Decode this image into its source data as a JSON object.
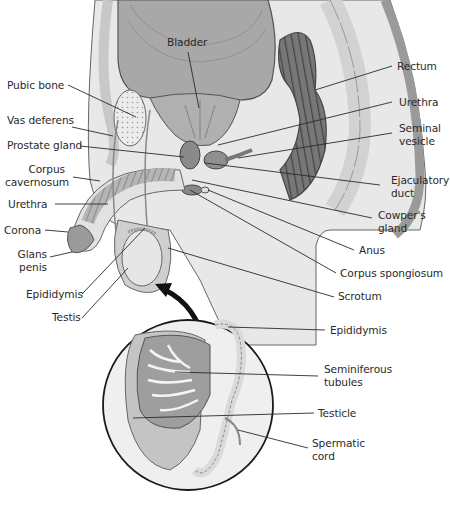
{
  "diagram": {
    "type": "anatomical cross-section",
    "colors": {
      "background": "#ffffff",
      "tissue_light": "#e4e4e4",
      "tissue_mid": "#c8c8c8",
      "tissue_dark": "#8e8e8e",
      "outline": "#555555",
      "leader": "#2a2a2a",
      "arrow": "#111111"
    },
    "labels": {
      "bladder": "Bladder",
      "pubic_bone": "Pubic bone",
      "vas_deferens": "Vas deferens",
      "prostate_gland": "Prostate gland",
      "corpus_cavernosum_1": "Corpus",
      "corpus_cavernosum_2": "cavernosum",
      "urethra_left": "Urethra",
      "corona": "Corona",
      "glans_penis_1": "Glans",
      "glans_penis_2": "penis",
      "epididymis_left": "Epididymis",
      "testis": "Testis",
      "rectum": "Rectum",
      "urethra_right": "Urethra",
      "seminal_vesicle_1": "Seminal",
      "seminal_vesicle_2": "vesicle",
      "ejaculatory_duct_1": "Ejaculatory",
      "ejaculatory_duct_2": "duct",
      "cowpers_gland_1": "Cowper's",
      "cowpers_gland_2": "gland",
      "anus": "Anus",
      "corpus_spongiosum": "Corpus spongiosum",
      "scrotum": "Scrotum"
    },
    "inset": {
      "labels": {
        "epididymis": "Epididymis",
        "seminiferous_tubules_1": "Seminiferous",
        "seminiferous_tubules_2": "tubules",
        "testicle": "Testicle",
        "spermatic_cord_1": "Spermatic",
        "spermatic_cord_2": "cord"
      }
    }
  }
}
